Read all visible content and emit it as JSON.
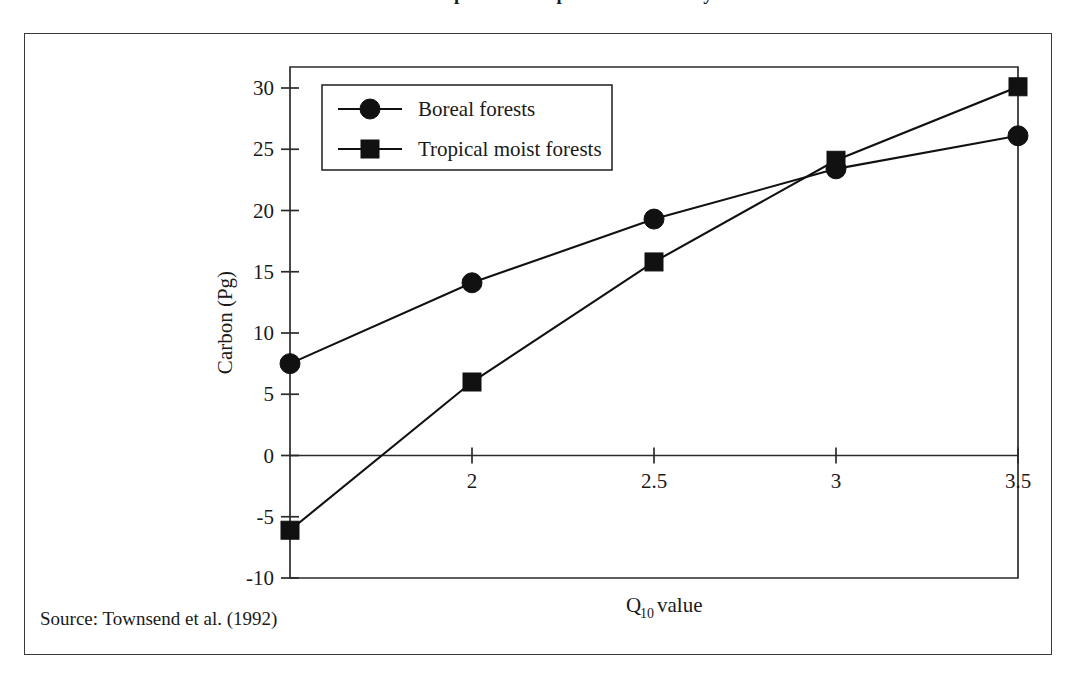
{
  "figure": {
    "source_note": "Source: Townsend et al. (1992)",
    "title_partial": "Carbon response to temperature sensitivity"
  },
  "chart_data": {
    "type": "line",
    "title": "",
    "xlabel": "Q10 value",
    "xlabel_base": "Q",
    "xlabel_sub": "10",
    "xlabel_tail": " value",
    "ylabel": "Carbon (Pg)",
    "xlim": [
      1.5,
      3.5
    ],
    "ylim": [
      -10,
      30
    ],
    "xticks": [
      2,
      2.5,
      3,
      3.5
    ],
    "xtick_labels": [
      "2",
      "2.5",
      "3",
      "3.5"
    ],
    "yticks": [
      -10,
      -5,
      0,
      5,
      10,
      15,
      20,
      25,
      30
    ],
    "ytick_labels": [
      "-10",
      "-5",
      "0",
      "5",
      "10",
      "15",
      "20",
      "25",
      "30"
    ],
    "grid": false,
    "legend_position": "upper-left-inside",
    "x": [
      1.5,
      2,
      2.5,
      3,
      3.5
    ],
    "series": [
      {
        "name": "Boreal forests",
        "marker": "circle",
        "values": [
          7.5,
          14.1,
          19.3,
          23.4,
          26.1
        ]
      },
      {
        "name": "Tropical moist forests",
        "marker": "square",
        "values": [
          -6.1,
          6.0,
          15.8,
          24.1,
          30.1
        ]
      }
    ],
    "colors": {
      "line": "#111111",
      "marker": "#111111",
      "axis": "#2b2b2b",
      "background": "#ffffff"
    }
  }
}
